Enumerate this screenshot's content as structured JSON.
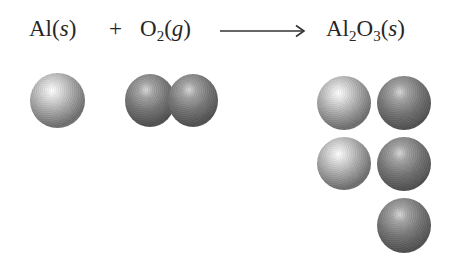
{
  "diagram": {
    "type": "chemical-equation-with-particle-models",
    "equation": {
      "reactant_1": {
        "symbol": "Al",
        "state": "s"
      },
      "operator": "+",
      "reactant_2": {
        "symbol": "O",
        "subscript": "2",
        "state": "g"
      },
      "arrow": "→",
      "product": {
        "parts": [
          {
            "symbol": "Al",
            "subscript": "2"
          },
          {
            "symbol": "O",
            "subscript": "3"
          }
        ],
        "state": "s"
      }
    },
    "labels": {
      "al_text": "Al(",
      "al_state": "s",
      "al_close": ")",
      "plus": "+",
      "o_text": "O",
      "o_sub": "2",
      "o_open": "(",
      "o_state": "g",
      "o_close": ")",
      "prod_al": "Al",
      "prod_al_sub": "2",
      "prod_o": "O",
      "prod_o_sub": "3",
      "prod_open": "(",
      "prod_state": "s",
      "prod_close": ")"
    },
    "particles": {
      "aluminum_atom": {
        "element": "Al",
        "count": 1,
        "shade": "light"
      },
      "oxygen_molecule": {
        "element": "O",
        "count": 2,
        "bonded": true,
        "shade": "dark"
      },
      "aluminum_oxide": {
        "atoms": [
          {
            "element": "Al",
            "row": 1,
            "col": 1
          },
          {
            "element": "O",
            "row": 1,
            "col": 2
          },
          {
            "element": "Al",
            "row": 2,
            "col": 1
          },
          {
            "element": "O",
            "row": 2,
            "col": 2
          },
          {
            "element": "O",
            "row": 3,
            "col": 2
          }
        ]
      }
    },
    "colors": {
      "background": "#ffffff",
      "text": "#262626",
      "al_atom": "#a8a8a8",
      "o_atom": "#737373"
    }
  }
}
